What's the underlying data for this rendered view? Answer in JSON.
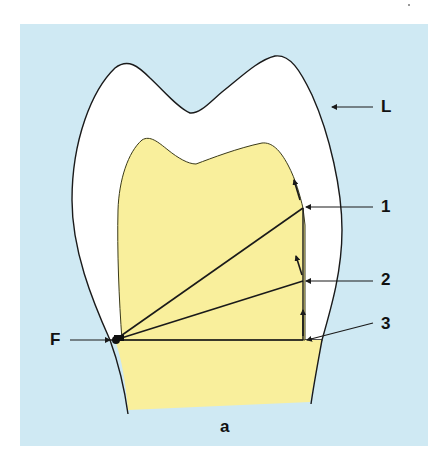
{
  "figure": {
    "panel_label": "a",
    "colors": {
      "background_panel": "#cfe9f3",
      "enamel": "#ffffff",
      "dentin": "#f9ef9c",
      "outline": "#1a1a1a"
    },
    "labels": {
      "L": "L",
      "one": "1",
      "two": "2",
      "three": "3",
      "F": "F"
    },
    "components": [
      {
        "id": "enamel-outline",
        "label": "L",
        "description": "outer tooth contour (white enamel region)"
      },
      {
        "id": "dentin",
        "description": "yellow inner region"
      },
      {
        "id": "fulcrum",
        "label": "F",
        "description": "pivot point at left margin"
      },
      {
        "id": "line-1",
        "label": "1",
        "description": "line from F to upper right corner with upward arrow"
      },
      {
        "id": "line-2",
        "label": "2",
        "description": "line from F to mid right edge with upward arrow"
      },
      {
        "id": "line-3",
        "label": "3",
        "description": "horizontal line from F to lower right edge with upward arrow"
      }
    ]
  }
}
